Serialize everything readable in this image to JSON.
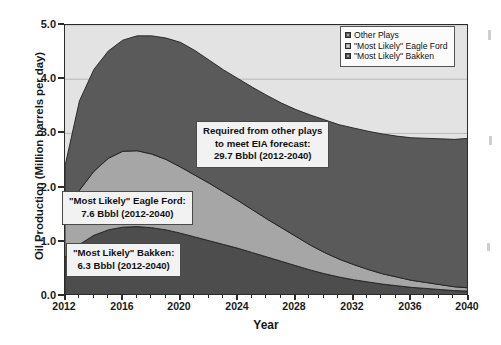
{
  "chart_data": {
    "type": "area",
    "stacked": true,
    "title": "",
    "xlabel": "Year",
    "ylabel": "Oil Production (Million barrels per day)",
    "xlim": [
      2012,
      2040
    ],
    "ylim": [
      0.0,
      5.0
    ],
    "ytick_labels": [
      "0.0",
      "1.0",
      "2.0",
      "3.0",
      "4.0",
      "5.0"
    ],
    "ytick_values": [
      0.0,
      1.0,
      2.0,
      3.0,
      4.0,
      5.0
    ],
    "xtick_labels": [
      "2012",
      "2016",
      "2020",
      "2024",
      "2028",
      "2032",
      "2036",
      "2040"
    ],
    "xtick_values": [
      2012,
      2016,
      2020,
      2024,
      2028,
      2032,
      2036,
      2040
    ],
    "grid": true,
    "legend_position": "top-right",
    "x": [
      2012,
      2013,
      2014,
      2015,
      2016,
      2017,
      2018,
      2019,
      2020,
      2021,
      2022,
      2023,
      2024,
      2025,
      2026,
      2027,
      2028,
      2029,
      2030,
      2031,
      2032,
      2033,
      2034,
      2035,
      2036,
      2037,
      2038,
      2039,
      2040
    ],
    "series": [
      {
        "name": "\"Most Likely\" Bakken",
        "color": "#4d4d4d",
        "values": [
          0.72,
          0.95,
          1.12,
          1.22,
          1.27,
          1.28,
          1.26,
          1.22,
          1.16,
          1.09,
          1.02,
          0.95,
          0.88,
          0.8,
          0.72,
          0.64,
          0.56,
          0.48,
          0.41,
          0.35,
          0.3,
          0.26,
          0.22,
          0.19,
          0.16,
          0.14,
          0.12,
          0.1,
          0.09
        ]
      },
      {
        "name": "\"Most Likely\" Eagle Ford",
        "color": "#a6a6a6",
        "values": [
          0.78,
          1.0,
          1.18,
          1.32,
          1.4,
          1.4,
          1.36,
          1.3,
          1.22,
          1.14,
          1.06,
          0.97,
          0.88,
          0.79,
          0.7,
          0.62,
          0.54,
          0.46,
          0.39,
          0.33,
          0.28,
          0.23,
          0.19,
          0.16,
          0.13,
          0.11,
          0.09,
          0.07,
          0.06
        ]
      },
      {
        "name": "Other Plays",
        "color": "#5a5a5a",
        "values": [
          0.9,
          1.65,
          1.88,
          1.98,
          2.05,
          2.12,
          2.18,
          2.24,
          2.3,
          2.3,
          2.27,
          2.25,
          2.25,
          2.26,
          2.28,
          2.3,
          2.34,
          2.4,
          2.45,
          2.48,
          2.52,
          2.55,
          2.58,
          2.6,
          2.63,
          2.66,
          2.69,
          2.72,
          2.76
        ]
      }
    ],
    "totals": [
      2.4,
      3.6,
      4.18,
      4.52,
      4.72,
      4.8,
      4.8,
      4.76,
      4.68,
      4.53,
      4.35,
      4.17,
      4.01,
      3.85,
      3.7,
      3.56,
      3.44,
      3.34,
      3.25,
      3.16,
      3.1,
      3.04,
      2.99,
      2.95,
      2.92,
      2.91,
      2.9,
      2.89,
      2.91
    ],
    "annotations": [
      {
        "id": "other-plays",
        "lines": [
          "Required from other plays",
          "to meet EIA forecast:",
          "29.7 Bbbl (2012-2040)"
        ]
      },
      {
        "id": "eagle-ford",
        "lines": [
          "\"Most Likely\" Eagle Ford:",
          "7.6 Bbbl (2012-2040)"
        ]
      },
      {
        "id": "bakken",
        "lines": [
          "\"Most Likely\" Bakken:",
          "6.3 Bbbl (2012-2040)"
        ]
      }
    ],
    "legend": [
      {
        "label": "Other Plays",
        "color": "#5a5a5a"
      },
      {
        "label": "\"Most Likely\" Eagle Ford",
        "color": "#a6a6a6"
      },
      {
        "label": "\"Most Likely\" Bakken",
        "color": "#4d4d4d"
      }
    ]
  },
  "axes": {
    "ylabel": "Oil Production (Million barrels per day)",
    "xlabel": "Year"
  },
  "annotations": {
    "other": {
      "line1": "Required from other plays",
      "line2": "to meet EIA forecast:",
      "line3": "29.7 Bbbl (2012-2040)"
    },
    "eagleford": {
      "line1": "\"Most Likely\" Eagle Ford:",
      "line2": "7.6 Bbbl (2012-2040)"
    },
    "bakken": {
      "line1": "\"Most Likely\" Bakken:",
      "line2": "6.3 Bbbl (2012-2040)"
    }
  },
  "legend": {
    "items": [
      {
        "label": "Other Plays"
      },
      {
        "label": "\"Most Likely\" Eagle Ford"
      },
      {
        "label": "\"Most Likely\" Bakken"
      }
    ]
  },
  "colors": {
    "bakken": "#4d4d4d",
    "eagle_ford": "#a6a6a6",
    "other_plays": "#5a5a5a",
    "plot_background": "#e3e3e3",
    "frame": "#2b2b2b",
    "page_background": "#ffffff"
  }
}
